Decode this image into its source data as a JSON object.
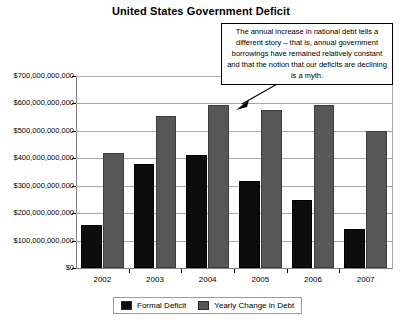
{
  "chart_data": {
    "type": "bar",
    "title": "United States Government Deficit",
    "xlabel": "",
    "ylabel": "",
    "categories": [
      "2002",
      "2003",
      "2004",
      "2005",
      "2006",
      "2007"
    ],
    "series": [
      {
        "name": "Formal Deficit",
        "color": "#0d0d0d",
        "values": [
          158000000000,
          378000000000,
          413000000000,
          318000000000,
          248000000000,
          143000000000
        ]
      },
      {
        "name": "Yearly Change in Debt",
        "color": "#575757",
        "values": [
          420000000000,
          555000000000,
          596000000000,
          576000000000,
          595000000000,
          500000000000
        ]
      }
    ],
    "ylim": [
      0,
      700000000000
    ],
    "ytick_values": [
      0,
      100000000000,
      200000000000,
      300000000000,
      400000000000,
      500000000000,
      600000000000,
      700000000000
    ],
    "ytick_labels": [
      "$0",
      "$100,000,000,000",
      "$200,000,000,000",
      "$300,000,000,000",
      "$400,000,000,000",
      "$500,000,000,000",
      "$600,000,000,000",
      "$700,000,000,000"
    ],
    "grid": true,
    "legend_position": "bottom",
    "annotations": [
      {
        "text": "The annual increase in national debt tells a different story – that is, annual government borrowings have remained relatively constant and that the notion that our deficits are declining is a myth.",
        "points_to": "2005 Yearly Change in Debt bar"
      }
    ]
  },
  "legend": {
    "entries": [
      {
        "label": "Formal Deficit"
      },
      {
        "label": "Yearly Change in Debt"
      }
    ]
  }
}
